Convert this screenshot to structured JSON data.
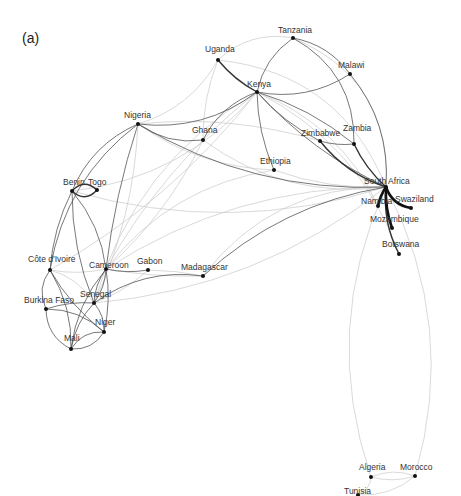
{
  "figure": {
    "panel_label": "(a)",
    "colors": {
      "edge_light": "#c8c8c8",
      "edge_dark": "#333333",
      "node": "#111111",
      "label": "#333333"
    }
  },
  "nodes": [
    {
      "id": "tanzania",
      "label": "Tanzania",
      "x": 293,
      "y": 38,
      "lx": 278,
      "ly": 33
    },
    {
      "id": "uganda",
      "label": "Uganda",
      "x": 218,
      "y": 60,
      "lx": 205,
      "ly": 52
    },
    {
      "id": "malawi",
      "label": "Malawi",
      "x": 350,
      "y": 74,
      "lx": 338,
      "ly": 68
    },
    {
      "id": "kenya",
      "label": "Kenya",
      "x": 257,
      "y": 92,
      "lx": 247,
      "ly": 87
    },
    {
      "id": "nigeria",
      "label": "Nigeria",
      "x": 138,
      "y": 124,
      "lx": 124,
      "ly": 118
    },
    {
      "id": "ghana",
      "label": "Ghana",
      "x": 203,
      "y": 140,
      "lx": 192,
      "ly": 133
    },
    {
      "id": "zimbabwe",
      "label": "Zimbabwe",
      "x": 320,
      "y": 141,
      "lx": 301,
      "ly": 136
    },
    {
      "id": "zambia",
      "label": "Zambia",
      "x": 354,
      "y": 144,
      "lx": 343,
      "ly": 131
    },
    {
      "id": "ethiopia",
      "label": "Ethiopia",
      "x": 274,
      "y": 170,
      "lx": 260,
      "ly": 164
    },
    {
      "id": "south_africa",
      "label": "South Africa",
      "x": 386,
      "y": 187,
      "lx": 364,
      "ly": 184
    },
    {
      "id": "namibia",
      "label": "Namibia",
      "x": 378,
      "y": 206,
      "lx": 361,
      "ly": 204
    },
    {
      "id": "swaziland",
      "label": "Swaziland",
      "x": 411,
      "y": 208,
      "lx": 395,
      "ly": 202
    },
    {
      "id": "mozambique",
      "label": "Mozambique",
      "x": 392,
      "y": 228,
      "lx": 370,
      "ly": 222
    },
    {
      "id": "botswana",
      "label": "Botswana",
      "x": 399,
      "y": 254,
      "lx": 382,
      "ly": 247
    },
    {
      "id": "benin",
      "label": "Benin",
      "x": 72,
      "y": 191,
      "lx": 63,
      "ly": 185
    },
    {
      "id": "togo",
      "label": "Togo",
      "x": 97,
      "y": 190,
      "lx": 88,
      "ly": 185
    },
    {
      "id": "cote_divoire",
      "label": "Côte d'Ivoire",
      "x": 50,
      "y": 270,
      "lx": 28,
      "ly": 262
    },
    {
      "id": "cameroon",
      "label": "Cameroon",
      "x": 106,
      "y": 269,
      "lx": 89,
      "ly": 268
    },
    {
      "id": "gabon",
      "label": "Gabon",
      "x": 148,
      "y": 270,
      "lx": 137,
      "ly": 264
    },
    {
      "id": "madagascar",
      "label": "Madagascar",
      "x": 203,
      "y": 276,
      "lx": 181,
      "ly": 270
    },
    {
      "id": "senegal",
      "label": "Senegal",
      "x": 94,
      "y": 303,
      "lx": 80,
      "ly": 297
    },
    {
      "id": "burkina_faso",
      "label": "Burkina Faso",
      "x": 46,
      "y": 309,
      "lx": 24,
      "ly": 303
    },
    {
      "id": "niger",
      "label": "Niger",
      "x": 104,
      "y": 332,
      "lx": 95,
      "ly": 325
    },
    {
      "id": "mali",
      "label": "Mali",
      "x": 71,
      "y": 349,
      "lx": 64,
      "ly": 341
    },
    {
      "id": "algeria",
      "label": "Algeria",
      "x": 371,
      "y": 477,
      "lx": 359,
      "ly": 470
    },
    {
      "id": "morocco",
      "label": "Morocco",
      "x": 415,
      "y": 476,
      "lx": 400,
      "ly": 470
    },
    {
      "id": "tunisia",
      "label": "Tunisia",
      "x": 358,
      "y": 495,
      "lx": 344,
      "ly": 494
    }
  ],
  "edges": [
    {
      "s": "uganda",
      "t": "tanzania",
      "c": -0.25,
      "w": "light"
    },
    {
      "s": "uganda",
      "t": "kenya",
      "c": 0.1,
      "w": "dark2"
    },
    {
      "s": "tanzania",
      "t": "kenya",
      "c": 0.2,
      "w": "dark"
    },
    {
      "s": "tanzania",
      "t": "malawi",
      "c": -0.2,
      "w": "dark"
    },
    {
      "s": "tanzania",
      "t": "zambia",
      "c": -0.3,
      "w": "dark"
    },
    {
      "s": "tanzania",
      "t": "south_africa",
      "c": -0.35,
      "w": "light"
    },
    {
      "s": "malawi",
      "t": "south_africa",
      "c": -0.2,
      "w": "dark"
    },
    {
      "s": "kenya",
      "t": "malawi",
      "c": 0.2,
      "w": "dark"
    },
    {
      "s": "kenya",
      "t": "zambia",
      "c": -0.1,
      "w": "dark"
    },
    {
      "s": "kenya",
      "t": "zimbabwe",
      "c": 0.1,
      "w": "dark"
    },
    {
      "s": "kenya",
      "t": "ethiopia",
      "c": 0.1,
      "w": "dark"
    },
    {
      "s": "kenya",
      "t": "south_africa",
      "c": 0.1,
      "w": "dark"
    },
    {
      "s": "kenya",
      "t": "nigeria",
      "c": -0.2,
      "w": "dark"
    },
    {
      "s": "kenya",
      "t": "ghana",
      "c": 0.2,
      "w": "dark"
    },
    {
      "s": "kenya",
      "t": "cameroon",
      "c": 0.1,
      "w": "light"
    },
    {
      "s": "kenya",
      "t": "benin",
      "c": -0.2,
      "w": "light"
    },
    {
      "s": "kenya",
      "t": "senegal",
      "c": 0.2,
      "w": "light"
    },
    {
      "s": "kenya",
      "t": "cote_divoire",
      "c": -0.1,
      "w": "light"
    },
    {
      "s": "kenya",
      "t": "botswana",
      "c": -0.2,
      "w": "light"
    },
    {
      "s": "kenya",
      "t": "namibia",
      "c": -0.2,
      "w": "light"
    },
    {
      "s": "uganda",
      "t": "nigeria",
      "c": -0.2,
      "w": "light"
    },
    {
      "s": "uganda",
      "t": "ghana",
      "c": 0.1,
      "w": "light"
    },
    {
      "s": "uganda",
      "t": "south_africa",
      "c": -0.3,
      "w": "light"
    },
    {
      "s": "nigeria",
      "t": "south_africa",
      "c": 0.15,
      "w": "dark"
    },
    {
      "s": "nigeria",
      "t": "ethiopia",
      "c": 0.15,
      "w": "light"
    },
    {
      "s": "nigeria",
      "t": "zimbabwe",
      "c": -0.1,
      "w": "light"
    },
    {
      "s": "nigeria",
      "t": "benin",
      "c": 0.2,
      "w": "dark"
    },
    {
      "s": "nigeria",
      "t": "cote_divoire",
      "c": 0.2,
      "w": "dark"
    },
    {
      "s": "nigeria",
      "t": "cameroon",
      "c": 0.05,
      "w": "dark"
    },
    {
      "s": "nigeria",
      "t": "senegal",
      "c": -0.1,
      "w": "light"
    },
    {
      "s": "nigeria",
      "t": "ghana",
      "c": 0.2,
      "w": "dark"
    },
    {
      "s": "ghana",
      "t": "south_africa",
      "c": 0.2,
      "w": "light"
    },
    {
      "s": "ghana",
      "t": "cameroon",
      "c": -0.1,
      "w": "light"
    },
    {
      "s": "zimbabwe",
      "t": "south_africa",
      "c": 0.15,
      "w": "dark2"
    },
    {
      "s": "zambia",
      "t": "south_africa",
      "c": 0.1,
      "w": "dark2"
    },
    {
      "s": "zimbabwe",
      "t": "zambia",
      "c": 0.1,
      "w": "dark"
    },
    {
      "s": "ethiopia",
      "t": "south_africa",
      "c": 0.1,
      "w": "light"
    },
    {
      "s": "ethiopia",
      "t": "cameroon",
      "c": 0.2,
      "w": "light"
    },
    {
      "s": "south_africa",
      "t": "namibia",
      "c": 0.1,
      "w": "dark3"
    },
    {
      "s": "south_africa",
      "t": "swaziland",
      "c": 0.3,
      "w": "dark3"
    },
    {
      "s": "south_africa",
      "t": "mozambique",
      "c": 0.1,
      "w": "dark3"
    },
    {
      "s": "south_africa",
      "t": "botswana",
      "c": 0.15,
      "w": "dark2"
    },
    {
      "s": "south_africa",
      "t": "madagascar",
      "c": 0.15,
      "w": "dark"
    },
    {
      "s": "south_africa",
      "t": "morocco",
      "c": -0.2,
      "w": "light"
    },
    {
      "s": "south_africa",
      "t": "algeria",
      "c": 0.2,
      "w": "light"
    },
    {
      "s": "south_africa",
      "t": "cameroon",
      "c": 0.15,
      "w": "light"
    },
    {
      "s": "south_africa",
      "t": "senegal",
      "c": -0.15,
      "w": "light"
    },
    {
      "s": "south_africa",
      "t": "benin",
      "c": -0.15,
      "w": "light"
    },
    {
      "s": "benin",
      "t": "togo",
      "c": 0.5,
      "w": "dark2"
    },
    {
      "s": "benin",
      "t": "togo",
      "c": -0.5,
      "w": "dark2"
    },
    {
      "s": "benin",
      "t": "cote_divoire",
      "c": 0.1,
      "w": "dark"
    },
    {
      "s": "benin",
      "t": "cameroon",
      "c": -0.15,
      "w": "dark"
    },
    {
      "s": "benin",
      "t": "senegal",
      "c": 0.1,
      "w": "dark"
    },
    {
      "s": "cote_divoire",
      "t": "cameroon",
      "c": 0.1,
      "w": "light"
    },
    {
      "s": "cote_divoire",
      "t": "burkina_faso",
      "c": 0.3,
      "w": "dark"
    },
    {
      "s": "cote_divoire",
      "t": "senegal",
      "c": -0.2,
      "w": "light"
    },
    {
      "s": "cote_divoire",
      "t": "mali",
      "c": -0.15,
      "w": "dark"
    },
    {
      "s": "cote_divoire",
      "t": "niger",
      "c": 0.1,
      "w": "dark"
    },
    {
      "s": "cameroon",
      "t": "senegal",
      "c": 0.15,
      "w": "dark"
    },
    {
      "s": "cameroon",
      "t": "senegal",
      "c": -0.15,
      "w": "dark"
    },
    {
      "s": "cameroon",
      "t": "gabon",
      "c": 0.1,
      "w": "dark"
    },
    {
      "s": "cameroon",
      "t": "niger",
      "c": -0.1,
      "w": "dark"
    },
    {
      "s": "cameroon",
      "t": "mali",
      "c": 0.15,
      "w": "dark"
    },
    {
      "s": "cameroon",
      "t": "madagascar",
      "c": 0.05,
      "w": "light"
    },
    {
      "s": "gabon",
      "t": "senegal",
      "c": -0.1,
      "w": "light"
    },
    {
      "s": "gabon",
      "t": "madagascar",
      "c": -0.05,
      "w": "light"
    },
    {
      "s": "senegal",
      "t": "madagascar",
      "c": -0.2,
      "w": "dark"
    },
    {
      "s": "senegal",
      "t": "burkina_faso",
      "c": 0.1,
      "w": "dark"
    },
    {
      "s": "senegal",
      "t": "mali",
      "c": 0.15,
      "w": "dark"
    },
    {
      "s": "senegal",
      "t": "niger",
      "c": -0.2,
      "w": "dark"
    },
    {
      "s": "burkina_faso",
      "t": "mali",
      "c": 0.3,
      "w": "dark"
    },
    {
      "s": "burkina_faso",
      "t": "niger",
      "c": -0.2,
      "w": "dark"
    },
    {
      "s": "mali",
      "t": "niger",
      "c": 0.3,
      "w": "dark"
    },
    {
      "s": "mali",
      "t": "niger",
      "c": -0.3,
      "w": "dark"
    },
    {
      "s": "madagascar",
      "t": "south_africa",
      "c": -0.25,
      "w": "light"
    },
    {
      "s": "algeria",
      "t": "morocco",
      "c": -0.2,
      "w": "light"
    },
    {
      "s": "algeria",
      "t": "morocco",
      "c": 0.15,
      "w": "light"
    },
    {
      "s": "tunisia",
      "t": "morocco",
      "c": 0.2,
      "w": "light"
    },
    {
      "s": "tunisia",
      "t": "algeria",
      "c": 0.3,
      "w": "light"
    }
  ]
}
